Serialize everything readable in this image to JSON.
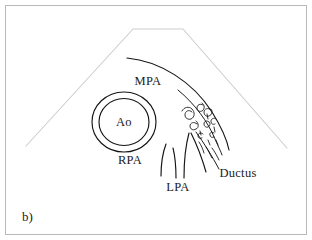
{
  "figure": {
    "panel_label": "b)",
    "modality": "echocardiogram-schematic-line-drawing",
    "background_color": "#ffffff",
    "frame_color": "#b9b9b9",
    "ink_color": "#151515",
    "sector_color": "#cdcdcd"
  },
  "labels": {
    "mpa": "MPA",
    "ao": "Ao",
    "rpa": "RPA",
    "lpa": "LPA",
    "ductus": "Ductus"
  },
  "structures": [
    {
      "name": "ultrasound-sector",
      "label": "",
      "description": "truncated-fan imaging sector outline",
      "color": "#cdcdcd"
    },
    {
      "name": "main-pulmonary-artery",
      "label": "MPA",
      "description": "large arcing vessel wall curving from upper-left to lower-right",
      "color": "#151515"
    },
    {
      "name": "aorta",
      "label": "Ao",
      "description": "double-walled circular cross-section of the aorta",
      "color": "#151515"
    },
    {
      "name": "right-pulmonary-artery",
      "label": "RPA",
      "description": "left branch vessel below the aorta",
      "color": "#151515"
    },
    {
      "name": "left-pulmonary-artery",
      "label": "LPA",
      "description": "central branch vessel descending inferiorly",
      "color": "#151515"
    },
    {
      "name": "ductus-arteriosus",
      "label": "Ductus",
      "description": "right-sided channel with turbulent flow curls",
      "color": "#151515"
    },
    {
      "name": "turbulent-flow",
      "label": "",
      "description": "spiral curl marks denoting turbulent jet flow at the ductus",
      "color": "#1d1d1d"
    }
  ]
}
